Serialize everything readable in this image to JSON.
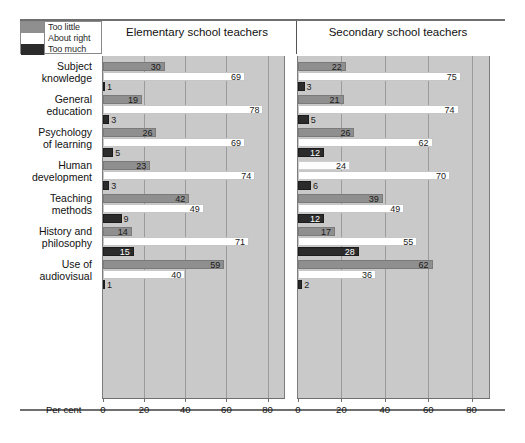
{
  "legend": {
    "items": [
      {
        "label": "Too little",
        "color": "#8f8f8f"
      },
      {
        "label": "About right",
        "color": "#ffffff"
      },
      {
        "label": "Too much",
        "color": "#2b2b2b"
      }
    ]
  },
  "axis": {
    "caption": "Per cent",
    "ticks": [
      0,
      20,
      40,
      60,
      80
    ],
    "min": 0,
    "max": 88
  },
  "chart_data": {
    "type": "bar",
    "orientation": "horizontal",
    "title": "",
    "xlabel": "Per cent",
    "ylabel": "",
    "xlim": [
      0,
      88
    ],
    "grid": true,
    "legend_position": "top-left",
    "panels": [
      {
        "name": "Elementary school teachers"
      },
      {
        "name": "Secondary school teachers"
      }
    ],
    "series": [
      {
        "name": "Too little",
        "color": "#8f8f8f"
      },
      {
        "name": "About right",
        "color": "#ffffff"
      },
      {
        "name": "Too much",
        "color": "#2b2b2b"
      }
    ],
    "categories": [
      "Subject knowledge",
      "General education",
      "Psychology of learning",
      "Human development",
      "Teaching methods",
      "History and philosophy",
      "Use of audiovisual"
    ],
    "values": {
      "Elementary school teachers": {
        "Too little": [
          30,
          19,
          26,
          23,
          42,
          14,
          59
        ],
        "About right": [
          69,
          78,
          69,
          74,
          49,
          71,
          40
        ],
        "Too much": [
          1,
          3,
          5,
          3,
          9,
          15,
          1
        ]
      },
      "Secondary school teachers": {
        "Too little": [
          22,
          21,
          26,
          24,
          39,
          17,
          62
        ],
        "About right": [
          75,
          74,
          62,
          70,
          49,
          55,
          36
        ],
        "Too much": [
          3,
          5,
          12,
          6,
          12,
          28,
          2
        ]
      }
    }
  },
  "rows": [
    {
      "label_line1": "Subject",
      "label_line2": "knowledge"
    },
    {
      "label_line1": "General",
      "label_line2": "education"
    },
    {
      "label_line1": "Psychology",
      "label_line2": "of learning"
    },
    {
      "label_line1": "Human",
      "label_line2": "development"
    },
    {
      "label_line1": "Teaching",
      "label_line2": "methods"
    },
    {
      "label_line1": "History and",
      "label_line2": "philosophy"
    },
    {
      "label_line1": "Use of",
      "label_line2": "audiovisual"
    }
  ]
}
